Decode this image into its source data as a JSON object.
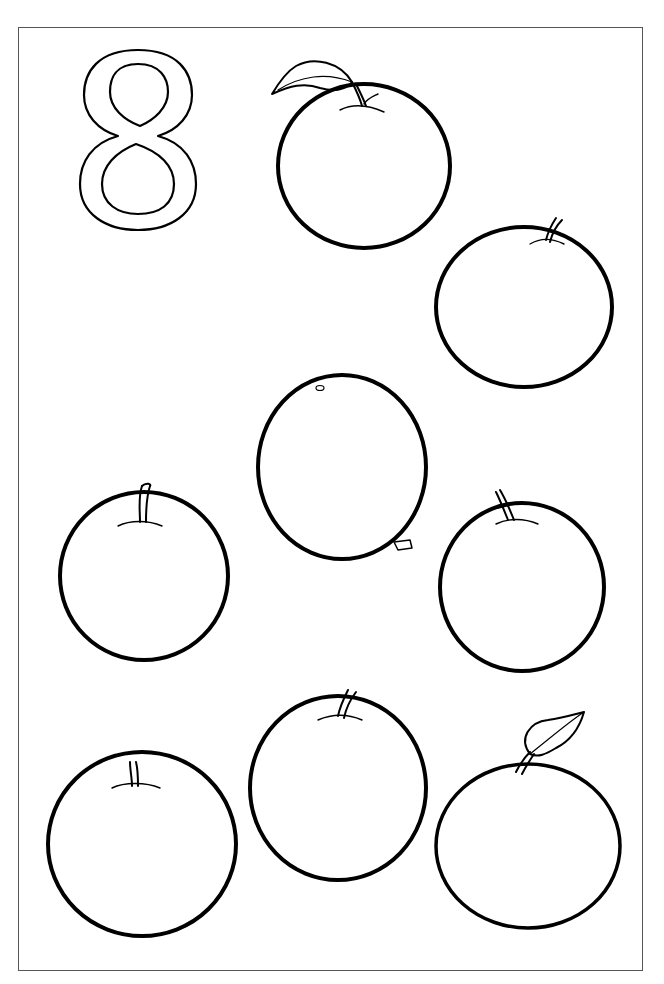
{
  "page": {
    "type": "coloring-page",
    "numeral": "8",
    "object_name": "apple",
    "object_count": 8,
    "colors": {
      "line": "#000000",
      "background": "#ffffff",
      "frame": "#555555"
    }
  },
  "apples": [
    {
      "id": 1,
      "position": "top-center",
      "feature": "leaf"
    },
    {
      "id": 2,
      "position": "upper-right",
      "feature": "stem"
    },
    {
      "id": 3,
      "position": "center",
      "feature": "stem-at-bottom"
    },
    {
      "id": 4,
      "position": "middle-left",
      "feature": "stem"
    },
    {
      "id": 5,
      "position": "middle-right",
      "feature": "stem"
    },
    {
      "id": 6,
      "position": "bottom-left",
      "feature": "stem"
    },
    {
      "id": 7,
      "position": "bottom-center",
      "feature": "stem"
    },
    {
      "id": 8,
      "position": "bottom-right",
      "feature": "leaf"
    }
  ]
}
